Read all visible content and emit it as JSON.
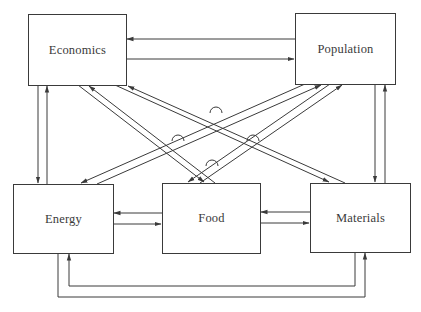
{
  "diagram": {
    "nodes": [
      {
        "id": "economics",
        "label": "Economics"
      },
      {
        "id": "population",
        "label": "Population"
      },
      {
        "id": "energy",
        "label": "Energy"
      },
      {
        "id": "food",
        "label": "Food"
      },
      {
        "id": "materials",
        "label": "Materials"
      }
    ],
    "edges": [
      {
        "from": "population",
        "to": "economics",
        "style": "single"
      },
      {
        "from": "economics",
        "to": "population",
        "style": "single"
      },
      {
        "from": "economics",
        "to": "energy",
        "style": "single"
      },
      {
        "from": "energy",
        "to": "economics",
        "style": "single"
      },
      {
        "from": "population",
        "to": "materials",
        "style": "single"
      },
      {
        "from": "materials",
        "to": "population",
        "style": "single"
      },
      {
        "from": "food",
        "to": "energy",
        "style": "single"
      },
      {
        "from": "energy",
        "to": "food",
        "style": "single"
      },
      {
        "from": "materials",
        "to": "food",
        "style": "single"
      },
      {
        "from": "food",
        "to": "materials",
        "style": "single"
      },
      {
        "from": "materials",
        "to": "energy",
        "style": "single"
      },
      {
        "from": "energy",
        "to": "materials",
        "style": "single"
      },
      {
        "from": "economics",
        "to": "food",
        "style": "double"
      },
      {
        "from": "food",
        "to": "economics",
        "style": "double"
      },
      {
        "from": "economics",
        "to": "materials",
        "style": "double"
      },
      {
        "from": "materials",
        "to": "economics",
        "style": "double"
      },
      {
        "from": "population",
        "to": "energy",
        "style": "double"
      },
      {
        "from": "energy",
        "to": "population",
        "style": "double"
      },
      {
        "from": "population",
        "to": "food",
        "style": "double"
      },
      {
        "from": "food",
        "to": "population",
        "style": "double"
      }
    ],
    "colors": {
      "line": "#3a3a3a",
      "background": "#ffffff"
    }
  }
}
